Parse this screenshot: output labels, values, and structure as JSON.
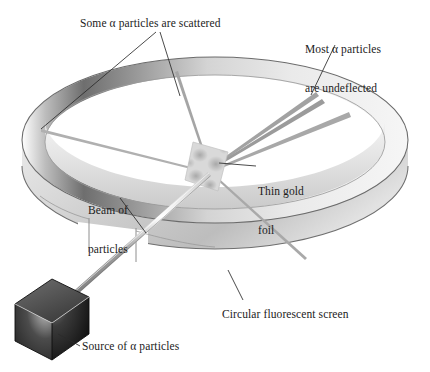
{
  "figure": {
    "background_color": "#ffffff",
    "text_color": "#1b1b1b"
  },
  "labels": {
    "scattered": "Some α particles are scattered",
    "undeflected_line1": "Most α particles",
    "undeflected_line2": "are undeflected",
    "gold_foil_line1": "Thin gold",
    "gold_foil_line2": "foil",
    "beam_line1": "Beam of",
    "beam_line2": "particles",
    "screen": "Circular fluorescent screen",
    "source": "Source of α particles"
  },
  "parts": {
    "ring": {
      "name": "Circular fluorescent screen",
      "shape": "elliptical band in perspective, open gap at front",
      "outer_color": "#8d8d8d",
      "inner_color": "#d8d8d8",
      "edge_color": "#4a4a4a"
    },
    "source": {
      "name": "Source of alpha particles",
      "shape": "isometric cube",
      "color_top": "#5a5a5a",
      "color_left": "#2f2f2f",
      "color_right": "#1c1c1c",
      "highlight": "#f2f2f2"
    },
    "foil": {
      "name": "Thin gold foil",
      "shape": "tilted rhombic sheet",
      "color": "#cfcfcf"
    },
    "beam": {
      "name": "Beam of particles",
      "color": "#9a9a9a",
      "description": "tapered tube from source to foil"
    },
    "undeflected_rays": {
      "count": 3,
      "color": "#9d9d9d",
      "description": "rays passing straight through foil toward upper-right rim"
    },
    "scattered_rays": {
      "count": 2,
      "color": "#a6a6a6",
      "description": "rays deflected to upper-left rim and lower-right rim"
    }
  },
  "leaders": {
    "scattered_count": 2,
    "undeflected_count": 1,
    "gold_foil_count": 1,
    "beam_count": 1,
    "screen_count": 1,
    "source_count": 1,
    "color": "#2a2a2a"
  }
}
